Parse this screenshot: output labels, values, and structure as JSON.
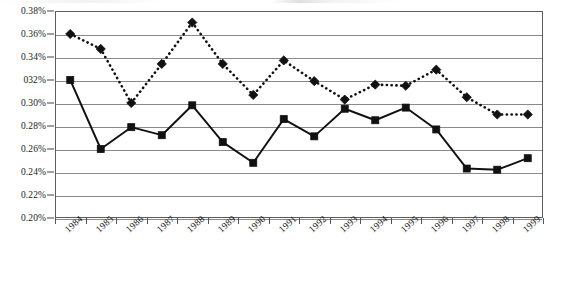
{
  "chart_data": {
    "type": "line",
    "title": "",
    "xlabel": "",
    "ylabel": "",
    "categories": [
      "1984",
      "1985",
      "1986",
      "1987",
      "1988",
      "1989",
      "1990",
      "1991",
      "1992",
      "1993",
      "1994",
      "1995",
      "1996",
      "1997",
      "1998",
      "1999"
    ],
    "ylim": [
      0.2,
      0.38
    ],
    "ytick_values": [
      0.38,
      0.36,
      0.34,
      0.32,
      0.3,
      0.28,
      0.26,
      0.24,
      0.22,
      0.2
    ],
    "ytick_labels": [
      "0.38%",
      "0.36%",
      "0.34%",
      "032%",
      "0.30%",
      "0.28%",
      "0.26%",
      "0.24%",
      "0.22%",
      "0.20%"
    ],
    "grid": true,
    "legend": "none",
    "series": [
      {
        "name": "dotted-diamond-series",
        "marker": "diamond",
        "line_style": "dotted",
        "color": "#111111",
        "values": [
          0.36,
          0.347,
          0.3,
          0.334,
          0.37,
          0.334,
          0.307,
          0.337,
          0.319,
          0.303,
          0.316,
          0.315,
          0.329,
          0.305,
          0.29,
          0.29
        ]
      },
      {
        "name": "solid-square-series",
        "marker": "square",
        "line_style": "solid",
        "color": "#111111",
        "values": [
          0.32,
          0.26,
          0.279,
          0.272,
          0.298,
          0.266,
          0.248,
          0.286,
          0.271,
          0.295,
          0.285,
          0.296,
          0.277,
          0.243,
          0.242,
          0.252
        ]
      }
    ]
  }
}
